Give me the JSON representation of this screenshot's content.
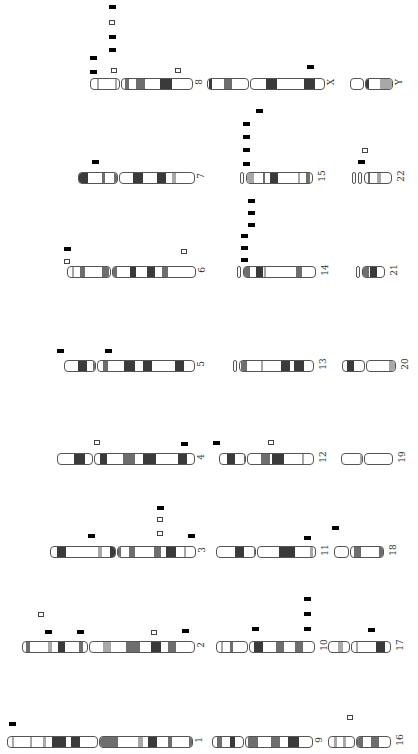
{
  "figure": {
    "legend": {
      "filled": "black bar marker",
      "open": "open square marker"
    },
    "colors": {
      "dark": "#3a3a3a",
      "mid": "#6e6e6e",
      "light": "#a8a8a8",
      "outline": "#555555",
      "marker": "#000000"
    }
  },
  "chromosomes": [
    {
      "id": "8",
      "label": "8",
      "x": 90,
      "y": 78,
      "arms": [
        [
          0,
          30
        ],
        [
          31,
          103
        ]
      ],
      "bands": [
        [
          7,
          2,
          "light"
        ],
        [
          25,
          2,
          "light"
        ],
        [
          35,
          4,
          "mid"
        ],
        [
          46,
          9,
          "mid"
        ],
        [
          70,
          12,
          "dark"
        ]
      ],
      "markers": [
        [
          90,
          70,
          "f"
        ],
        [
          90,
          56,
          "f"
        ],
        [
          109,
          48,
          "f"
        ],
        [
          109,
          35,
          "f"
        ],
        [
          109,
          20,
          "o"
        ],
        [
          109,
          5,
          "f"
        ],
        [
          111,
          68,
          "o"
        ],
        [
          175,
          68,
          "o"
        ]
      ]
    },
    {
      "id": "X",
      "label": "X",
      "x": 207,
      "y": 78,
      "arms": [
        [
          0,
          42
        ],
        [
          43,
          118
        ]
      ],
      "bands": [
        [
          2,
          3,
          "dark"
        ],
        [
          17,
          8,
          "mid"
        ],
        [
          59,
          11,
          "dark"
        ],
        [
          97,
          11,
          "dark"
        ]
      ],
      "markers": [
        [
          307,
          65,
          "f"
        ]
      ]
    },
    {
      "id": "Y",
      "label": "Y",
      "x": 350,
      "y": 78,
      "arms": [
        [
          0,
          14
        ],
        [
          15,
          43
        ]
      ],
      "bands": [
        [
          16,
          3,
          "dark"
        ],
        [
          30,
          13,
          "light"
        ]
      ],
      "markers": []
    },
    {
      "id": "7",
      "label": "7",
      "x": 78,
      "y": 172,
      "arms": [
        [
          0,
          40
        ],
        [
          41,
          117
        ]
      ],
      "bands": [
        [
          1,
          9,
          "dark"
        ],
        [
          24,
          3,
          "mid"
        ],
        [
          36,
          5,
          "mid"
        ],
        [
          55,
          10,
          "dark"
        ],
        [
          79,
          9,
          "dark"
        ],
        [
          94,
          4,
          "light"
        ]
      ],
      "markers": [
        [
          92,
          160,
          "f"
        ]
      ]
    },
    {
      "id": "15",
      "label": "15",
      "x": 240,
      "y": 172,
      "arms": [
        [
          0,
          4
        ],
        [
          6,
          73
        ]
      ],
      "bands": [
        [
          7,
          7,
          "light"
        ],
        [
          23,
          2,
          "mid"
        ],
        [
          30,
          8,
          "dark"
        ],
        [
          58,
          2,
          "light"
        ],
        [
          66,
          4,
          "mid"
        ]
      ],
      "markers": [
        [
          243,
          162,
          "f"
        ],
        [
          243,
          148,
          "f"
        ],
        [
          243,
          135,
          "f"
        ],
        [
          243,
          122,
          "f"
        ],
        [
          256,
          109,
          "f"
        ]
      ]
    },
    {
      "id": "22",
      "label": "22",
      "x": 352,
      "y": 172,
      "arms": [
        [
          0,
          4
        ],
        [
          6,
          10
        ],
        [
          12,
          40
        ]
      ],
      "bands": [
        [
          16,
          2,
          "mid"
        ],
        [
          25,
          4,
          "light"
        ]
      ],
      "markers": [
        [
          358,
          160,
          "f"
        ],
        [
          362,
          148,
          "o"
        ]
      ]
    },
    {
      "id": "6",
      "label": "6",
      "x": 67,
      "y": 266,
      "arms": [
        [
          0,
          44
        ],
        [
          45,
          129
        ]
      ],
      "bands": [
        [
          5,
          2,
          "light"
        ],
        [
          13,
          5,
          "mid"
        ],
        [
          35,
          7,
          "mid"
        ],
        [
          45,
          5,
          "mid"
        ],
        [
          63,
          6,
          "dark"
        ],
        [
          80,
          8,
          "dark"
        ],
        [
          95,
          6,
          "mid"
        ]
      ],
      "markers": [
        [
          64,
          247,
          "f"
        ],
        [
          64,
          259,
          "o"
        ],
        [
          181,
          249,
          "o"
        ]
      ]
    },
    {
      "id": "14",
      "label": "14",
      "x": 237,
      "y": 266,
      "arms": [
        [
          0,
          4
        ],
        [
          6,
          79
        ]
      ],
      "bands": [
        [
          7,
          6,
          "mid"
        ],
        [
          19,
          7,
          "dark"
        ],
        [
          27,
          2,
          "light"
        ],
        [
          59,
          6,
          "mid"
        ]
      ],
      "markers": [
        [
          241,
          258,
          "f"
        ],
        [
          241,
          246,
          "f"
        ],
        [
          241,
          234,
          "f"
        ],
        [
          248,
          223,
          "f"
        ],
        [
          248,
          211,
          "f"
        ],
        [
          248,
          199,
          "f"
        ]
      ]
    },
    {
      "id": "21",
      "label": "21",
      "x": 356,
      "y": 266,
      "arms": [
        [
          0,
          4
        ],
        [
          6,
          29
        ]
      ],
      "bands": [
        [
          7,
          6,
          "mid"
        ],
        [
          14,
          7,
          "dark"
        ]
      ],
      "markers": []
    },
    {
      "id": "5",
      "label": "5",
      "x": 64,
      "y": 360,
      "arms": [
        [
          0,
          32
        ],
        [
          33,
          131
        ]
      ],
      "bands": [
        [
          14,
          9,
          "dark"
        ],
        [
          29,
          5,
          "mid"
        ],
        [
          39,
          5,
          "mid"
        ],
        [
          60,
          11,
          "dark"
        ],
        [
          79,
          9,
          "dark"
        ],
        [
          111,
          9,
          "dark"
        ]
      ],
      "markers": [
        [
          57,
          349,
          "f"
        ],
        [
          105,
          349,
          "f"
        ]
      ]
    },
    {
      "id": "13",
      "label": "13",
      "x": 233,
      "y": 360,
      "arms": [
        [
          0,
          4
        ],
        [
          6,
          81
        ]
      ],
      "bands": [
        [
          8,
          6,
          "mid"
        ],
        [
          28,
          2,
          "light"
        ],
        [
          48,
          9,
          "dark"
        ],
        [
          61,
          10,
          "dark"
        ]
      ],
      "markers": []
    },
    {
      "id": "20",
      "label": "20",
      "x": 342,
      "y": 360,
      "arms": [
        [
          0,
          23
        ],
        [
          24,
          54
        ]
      ],
      "bands": [
        [
          5,
          7,
          "dark"
        ],
        [
          47,
          6,
          "light"
        ]
      ],
      "markers": []
    },
    {
      "id": "4",
      "label": "4",
      "x": 57,
      "y": 453,
      "arms": [
        [
          0,
          36
        ],
        [
          37,
          138
        ]
      ],
      "bands": [
        [
          17,
          11,
          "dark"
        ],
        [
          36,
          3,
          "light"
        ],
        [
          43,
          7,
          "dark"
        ],
        [
          66,
          12,
          "mid"
        ],
        [
          86,
          13,
          "dark"
        ],
        [
          121,
          9,
          "dark"
        ]
      ],
      "markers": [
        [
          94,
          440,
          "o"
        ],
        [
          181,
          442,
          "f"
        ],
        [
          213,
          441,
          "f"
        ],
        [
          268,
          440,
          "o"
        ]
      ]
    },
    {
      "id": "12",
      "label": "12",
      "x": 219,
      "y": 453,
      "arms": [
        [
          0,
          27
        ],
        [
          28,
          95
        ]
      ],
      "bands": [
        [
          8,
          8,
          "dark"
        ],
        [
          25,
          4,
          "mid"
        ],
        [
          42,
          9,
          "mid"
        ],
        [
          53,
          12,
          "dark"
        ],
        [
          83,
          2,
          "light"
        ]
      ],
      "markers": []
    },
    {
      "id": "19",
      "label": "19",
      "x": 341,
      "y": 453,
      "arms": [
        [
          0,
          22
        ],
        [
          23,
          52
        ]
      ],
      "bands": [
        [
          19,
          8,
          "light"
        ]
      ],
      "markers": []
    },
    {
      "id": "3",
      "label": "3",
      "x": 50,
      "y": 546,
      "arms": [
        [
          0,
          66
        ],
        [
          67,
          146
        ]
      ],
      "bands": [
        [
          7,
          9,
          "dark"
        ],
        [
          48,
          4,
          "light"
        ],
        [
          60,
          5,
          "dark"
        ],
        [
          67,
          4,
          "mid"
        ],
        [
          79,
          6,
          "mid"
        ],
        [
          104,
          7,
          "mid"
        ],
        [
          116,
          10,
          "dark"
        ],
        [
          134,
          2,
          "light"
        ]
      ],
      "markers": [
        [
          88,
          534,
          "f"
        ],
        [
          157,
          531,
          "o"
        ],
        [
          157,
          517,
          "o"
        ],
        [
          157,
          506,
          "f"
        ],
        [
          188,
          534,
          "f"
        ]
      ]
    },
    {
      "id": "11",
      "label": "11",
      "x": 216,
      "y": 546,
      "arms": [
        [
          0,
          40
        ],
        [
          41,
          100
        ]
      ],
      "bands": [
        [
          19,
          9,
          "dark"
        ],
        [
          38,
          5,
          "mid"
        ],
        [
          63,
          16,
          "dark"
        ],
        [
          94,
          3,
          "light"
        ]
      ],
      "markers": [
        [
          304,
          536,
          "f"
        ],
        [
          332,
          526,
          "f"
        ]
      ]
    },
    {
      "id": "18",
      "label": "18",
      "x": 334,
      "y": 546,
      "arms": [
        [
          0,
          15
        ],
        [
          16,
          50
        ]
      ],
      "bands": [
        [
          20,
          7,
          "mid"
        ],
        [
          45,
          9,
          "mid"
        ]
      ],
      "markers": []
    },
    {
      "id": "2",
      "label": "2",
      "x": 22,
      "y": 641,
      "arms": [
        [
          0,
          66
        ],
        [
          67,
          173
        ]
      ],
      "bands": [
        [
          4,
          4,
          "mid"
        ],
        [
          26,
          4,
          "light"
        ],
        [
          36,
          7,
          "dark"
        ],
        [
          57,
          4,
          "mid"
        ],
        [
          81,
          8,
          "light"
        ],
        [
          104,
          14,
          "mid"
        ],
        [
          129,
          10,
          "dark"
        ],
        [
          146,
          8,
          "mid"
        ]
      ],
      "markers": [
        [
          38,
          612,
          "o"
        ],
        [
          45,
          630,
          "f"
        ],
        [
          77,
          630,
          "f"
        ],
        [
          151,
          630,
          "o"
        ],
        [
          182,
          629,
          "f"
        ]
      ]
    },
    {
      "id": "10",
      "label": "10",
      "x": 216,
      "y": 641,
      "arms": [
        [
          0,
          32
        ],
        [
          33,
          99
        ]
      ],
      "bands": [
        [
          5,
          2,
          "light"
        ],
        [
          14,
          3,
          "mid"
        ],
        [
          38,
          9,
          "dark"
        ],
        [
          60,
          8,
          "mid"
        ],
        [
          79,
          8,
          "mid"
        ]
      ],
      "markers": [
        [
          252,
          627,
          "f"
        ],
        [
          304,
          627,
          "f"
        ],
        [
          304,
          612,
          "f"
        ],
        [
          304,
          597,
          "f"
        ]
      ]
    },
    {
      "id": "17",
      "label": "17",
      "x": 328,
      "y": 641,
      "arms": [
        [
          0,
          22
        ],
        [
          23,
          63
        ]
      ],
      "bands": [
        [
          10,
          5,
          "light"
        ],
        [
          28,
          2,
          "light"
        ],
        [
          48,
          9,
          "dark"
        ]
      ],
      "markers": [
        [
          368,
          628,
          "f"
        ]
      ]
    },
    {
      "id": "1",
      "label": "1",
      "x": 7,
      "y": 736,
      "arms": [
        [
          0,
          91
        ],
        [
          92,
          186
        ]
      ],
      "bands": [
        [
          5,
          2,
          "light"
        ],
        [
          23,
          2,
          "light"
        ],
        [
          36,
          3,
          "light"
        ],
        [
          45,
          14,
          "dark"
        ],
        [
          64,
          9,
          "dark"
        ],
        [
          93,
          18,
          "mid"
        ],
        [
          131,
          5,
          "light"
        ],
        [
          141,
          9,
          "dark"
        ],
        [
          161,
          4,
          "mid"
        ],
        [
          182,
          3,
          "mid"
        ]
      ],
      "markers": [
        [
          9,
          722,
          "f"
        ]
      ]
    },
    {
      "id": "9",
      "label": "9",
      "x": 212,
      "y": 736,
      "arms": [
        [
          0,
          32
        ],
        [
          33,
          101
        ]
      ],
      "bands": [
        [
          5,
          5,
          "mid"
        ],
        [
          18,
          5,
          "dark"
        ],
        [
          36,
          10,
          "mid"
        ],
        [
          59,
          9,
          "mid"
        ],
        [
          76,
          11,
          "dark"
        ]
      ],
      "markers": []
    },
    {
      "id": "16",
      "label": "16",
      "x": 328,
      "y": 736,
      "arms": [
        [
          0,
          27
        ],
        [
          28,
          63
        ]
      ],
      "bands": [
        [
          6,
          3,
          "light"
        ],
        [
          15,
          3,
          "light"
        ],
        [
          28,
          7,
          "mid"
        ],
        [
          43,
          8,
          "mid"
        ]
      ],
      "markers": [
        [
          347,
          715,
          "o"
        ]
      ]
    }
  ]
}
